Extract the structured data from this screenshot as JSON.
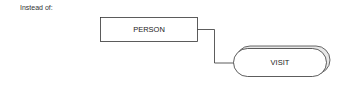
{
  "caption": "Instead of:",
  "diagram": {
    "nodes": [
      {
        "id": "person",
        "label": "PERSON",
        "shape": "rectangle"
      },
      {
        "id": "visit",
        "label": "VISIT",
        "shape": "stadium-stacked"
      }
    ],
    "edges": [
      {
        "from": "person",
        "to": "visit",
        "style": "orthogonal-line"
      }
    ]
  }
}
